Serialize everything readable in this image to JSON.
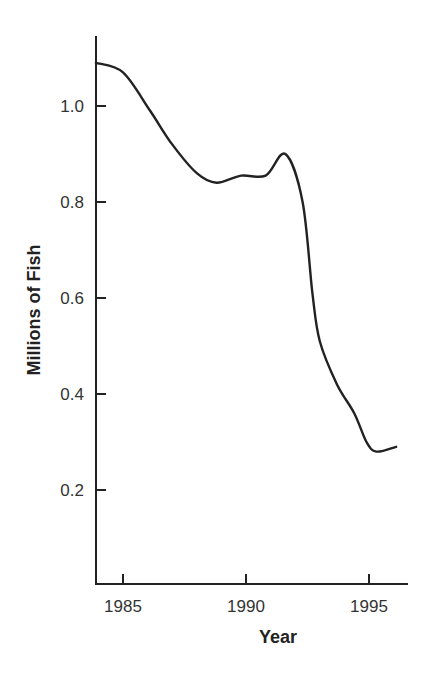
{
  "chart_data": {
    "type": "line",
    "title": "",
    "xlabel": "Year",
    "ylabel": "Millions of Fish",
    "xlim": [
      1983.9,
      1996.6
    ],
    "ylim": [
      0.0,
      1.15
    ],
    "x_ticks": [
      1985,
      1990,
      1995
    ],
    "x_tick_labels": [
      "1985",
      "1990",
      "1995"
    ],
    "y_ticks": [
      0.2,
      0.4,
      0.6,
      0.8,
      1.0
    ],
    "y_tick_labels": [
      "0.2",
      "0.4",
      "0.6",
      "0.8",
      "1.0"
    ],
    "grid": false,
    "legend": null,
    "series": [
      {
        "name": "Fish population",
        "color": "#222222",
        "x": [
          1983.9,
          1985.0,
          1986.1,
          1987.0,
          1988.0,
          1988.8,
          1989.8,
          1990.8,
          1991.6,
          1992.3,
          1992.7,
          1993.0,
          1993.7,
          1994.4,
          1994.9,
          1995.3,
          1996.1
        ],
        "y": [
          1.09,
          1.07,
          0.99,
          0.92,
          0.86,
          0.84,
          0.855,
          0.855,
          0.9,
          0.8,
          0.61,
          0.51,
          0.42,
          0.36,
          0.3,
          0.28,
          0.29
        ]
      }
    ]
  }
}
